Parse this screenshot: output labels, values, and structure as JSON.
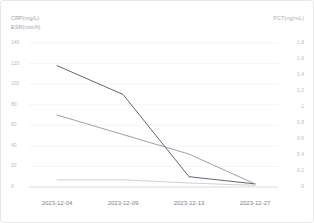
{
  "card": {
    "background": "#ffffff",
    "border_color": "#e8e8ea"
  },
  "axis_titles": {
    "crp": "CRP(mg/L)",
    "esr": "ESR(mm/h)",
    "pct": "PCT(ng/mL)"
  },
  "chart_data": {
    "type": "line",
    "title": "",
    "xlabel": "",
    "ylabel": "CRP(mg/L) ESR(mm/h)",
    "y2label": "PCT(ng/mL)",
    "grid": true,
    "legend": "none",
    "categories": [
      "2023-12-04",
      "2023-12-09",
      "2023-12-13",
      "2023-12-27"
    ],
    "ylim": [
      0,
      140
    ],
    "yticks": [
      0,
      20,
      40,
      60,
      80,
      100,
      120,
      140
    ],
    "ytick_labels": [
      "0",
      "20",
      "40",
      "60",
      "80",
      "100",
      "120",
      "140"
    ],
    "y2lim": [
      0,
      1.8
    ],
    "y2ticks": [
      0,
      0.2,
      0.4,
      0.6,
      0.8,
      1,
      1.2,
      1.4,
      1.6,
      1.8
    ],
    "y2tick_labels": [
      "0",
      "0.2",
      "0.4",
      "0.6",
      "0.8",
      "1",
      "1.2",
      "1.4",
      "1.6",
      "1.8"
    ],
    "series": [
      {
        "name": "ESR(mm/h)",
        "axis": "left",
        "color": "#5a5f66",
        "values": [
          118,
          90,
          10,
          3
        ]
      },
      {
        "name": "CRP(mg/L)",
        "axis": "left",
        "color": "#8a9099",
        "values": [
          70,
          51,
          32,
          3
        ]
      },
      {
        "name": "PCT(ng/mL)",
        "axis": "right",
        "color": "#c3c8ce",
        "values": [
          0.09,
          0.09,
          0.05,
          0.02
        ]
      }
    ]
  }
}
